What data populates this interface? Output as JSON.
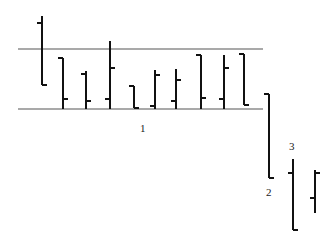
{
  "chart_data": {
    "type": "ohlc",
    "title": "",
    "xlabel": "",
    "ylabel": "",
    "grid": false,
    "legend": null,
    "value_note": "relative price units; 0 = lower range line, 60 = upper range line",
    "range_lines": {
      "upper": 60,
      "lower": 0,
      "x_start_bar": 0,
      "x_end_bar": 10
    },
    "bars": [
      {
        "index": 1,
        "open": 86,
        "high": 93,
        "low": 24,
        "close": 24
      },
      {
        "index": 2,
        "open": 51,
        "high": 51,
        "low": 0,
        "close": 10
      },
      {
        "index": 3,
        "open": 35,
        "high": 38,
        "low": 0,
        "close": 8
      },
      {
        "index": 4,
        "open": 10,
        "high": 68,
        "low": 0,
        "close": 41
      },
      {
        "index": 5,
        "open": 23,
        "high": 23,
        "low": 1,
        "close": 1
      },
      {
        "index": 6,
        "open": 3,
        "high": 39,
        "low": 0,
        "close": 34
      },
      {
        "index": 7,
        "open": 8,
        "high": 40,
        "low": 0,
        "close": 29
      },
      {
        "index": 8,
        "open": 54,
        "high": 54,
        "low": 0,
        "close": 11
      },
      {
        "index": 9,
        "open": 10,
        "high": 54,
        "low": 0,
        "close": 41
      },
      {
        "index": 10,
        "open": 55,
        "high": 55,
        "low": 4,
        "close": 4
      },
      {
        "index": 11,
        "open": 15,
        "high": 15,
        "low": -69,
        "close": -69
      },
      {
        "index": 12,
        "open": -64,
        "high": -50,
        "low": -121,
        "close": -121
      },
      {
        "index": 13,
        "open": -89,
        "high": -61,
        "low": -104,
        "close": -64
      }
    ],
    "annotations": [
      {
        "text": "1",
        "near": "below range, center"
      },
      {
        "text": "2",
        "near": "below bar 11"
      },
      {
        "text": "3",
        "near": "above bar 12"
      }
    ]
  },
  "labels": {
    "one": "1",
    "two": "2",
    "three": "3"
  },
  "style": {
    "bar_color": "#111111",
    "line_color": "#555555"
  }
}
